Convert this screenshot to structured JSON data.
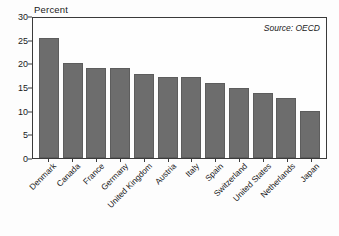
{
  "chart_data": {
    "type": "bar",
    "title": "",
    "ylabel": "Percent",
    "xlabel": "",
    "ylim": [
      0,
      30
    ],
    "yticks": [
      0,
      5,
      10,
      15,
      20,
      25,
      30
    ],
    "grid": false,
    "legend": null,
    "annotations": [
      {
        "name": "source-note",
        "text": "Source: OECD",
        "position": "top-right",
        "style": "italic"
      }
    ],
    "categories": [
      "Denmark",
      "Canada",
      "France",
      "Germany",
      "United Kingdom",
      "Austria",
      "Italy",
      "Spain",
      "Switzerland",
      "United States",
      "Netherlands",
      "Japan"
    ],
    "values": [
      25.3,
      20.1,
      19.0,
      19.0,
      17.8,
      17.1,
      17.1,
      15.8,
      14.8,
      13.8,
      12.7,
      9.9
    ],
    "bar_color": "#6d6d6d",
    "axis_color": "#3a3a3a",
    "background": "#fefefe"
  },
  "caption": ""
}
